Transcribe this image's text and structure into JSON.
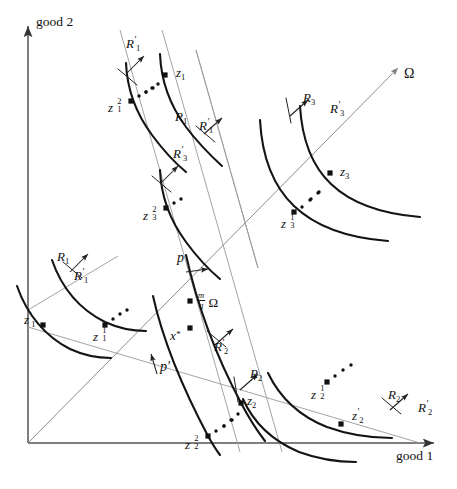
{
  "figure": {
    "type": "economics-edgeworth-offer-curve-diagram",
    "axes": {
      "x_label": "good 1",
      "y_label": "good 2",
      "origin": {
        "x": 28,
        "y": 443
      },
      "x_end": {
        "x": 440,
        "y": 443
      },
      "y_end": {
        "x": 28,
        "y": 22
      }
    },
    "colors": {
      "axis": "#555555",
      "thin_line": "#9a9a9a",
      "curve": "#141414",
      "point": "#111111",
      "text": "#1a1a1a",
      "background": "#ffffff"
    }
  },
  "labels": {
    "y_axis": "good 2",
    "x_axis": "good 1",
    "omega_ray": "Ω",
    "price_p": "p",
    "price_p_prime": "p′",
    "endowment_point": {
      "num": "m",
      "den": "q",
      "omega": "Ω"
    },
    "x_star": "x",
    "x_star_mark": "*"
  },
  "preference_labels": [
    {
      "name": "R1-upper",
      "base": "R",
      "sub": "1",
      "prime": "",
      "x": 175,
      "y": 110
    },
    {
      "name": "R1p-upper",
      "base": "R",
      "sub": "1",
      "prime": "′",
      "x": 199,
      "y": 118
    },
    {
      "name": "R1p-top",
      "base": "R",
      "sub": "1",
      "prime": "′",
      "x": 126,
      "y": 36
    },
    {
      "name": "R3p-mid",
      "base": "R",
      "sub": "3",
      "prime": "′",
      "x": 173,
      "y": 146
    },
    {
      "name": "R1-left",
      "base": "R",
      "sub": "1",
      "prime": "",
      "x": 57,
      "y": 250
    },
    {
      "name": "R1p-left",
      "base": "R",
      "sub": "1",
      "prime": "′",
      "x": 74,
      "y": 268
    },
    {
      "name": "R3-right",
      "base": "R",
      "sub": "3",
      "prime": "",
      "x": 303,
      "y": 91
    },
    {
      "name": "R3p-right",
      "base": "R",
      "sub": "3",
      "prime": "′",
      "x": 330,
      "y": 101
    },
    {
      "name": "R2p-center",
      "base": "R",
      "sub": "2",
      "prime": "′",
      "x": 214,
      "y": 339
    },
    {
      "name": "R2-bottom",
      "base": "R",
      "sub": "2",
      "prime": "",
      "x": 250,
      "y": 367
    },
    {
      "name": "R2-lower",
      "base": "R",
      "sub": "2",
      "prime": "",
      "x": 388,
      "y": 388
    },
    {
      "name": "R2p-lower",
      "base": "R",
      "sub": "2",
      "prime": "′",
      "x": 418,
      "y": 400
    }
  ],
  "allocation_points": [
    {
      "name": "z1",
      "base": "z",
      "sub": "1",
      "sup": "",
      "prime": "",
      "px": 165,
      "py": 75,
      "lx": 176,
      "ly": 66
    },
    {
      "name": "z1-sq",
      "base": "z",
      "sub": "1",
      "sup": "2",
      "prime": "",
      "px": 131,
      "py": 101,
      "lx": 108,
      "ly": 101
    },
    {
      "name": "z3-sq",
      "base": "z",
      "sub": "3",
      "sup": "2",
      "prime": "",
      "px": 166,
      "py": 208,
      "lx": 143,
      "ly": 209
    },
    {
      "name": "z3",
      "base": "z",
      "sub": "3",
      "sup": "",
      "prime": "",
      "px": 330,
      "py": 173,
      "lx": 340,
      "ly": 165
    },
    {
      "name": "z3-one",
      "base": "z",
      "sub": "3",
      "sup": "1",
      "prime": "",
      "px": 294,
      "py": 212,
      "lx": 281,
      "ly": 217
    },
    {
      "name": "z1-prime",
      "base": "z",
      "sub": "1",
      "sup": "",
      "prime": "′",
      "px": 43,
      "py": 325,
      "lx": 24,
      "ly": 312
    },
    {
      "name": "z1-one",
      "base": "z",
      "sub": "1",
      "sup": "1",
      "prime": "",
      "px": 105,
      "py": 325,
      "lx": 93,
      "ly": 330
    },
    {
      "name": "mq-omega",
      "base": "",
      "sub": "",
      "sup": "",
      "prime": "",
      "px": 190,
      "py": 301,
      "lx": 197,
      "ly": 294
    },
    {
      "name": "x-star",
      "base": "x",
      "sub": "",
      "sup": "",
      "prime": "",
      "px": 190,
      "py": 328,
      "lx": 172,
      "ly": 334
    },
    {
      "name": "z2",
      "base": "z",
      "sub": "2",
      "sup": "",
      "prime": "",
      "px": 241,
      "py": 403,
      "lx": 247,
      "ly": 394
    },
    {
      "name": "z2-sq",
      "base": "z",
      "sub": "2",
      "sup": "2",
      "prime": "",
      "px": 208,
      "py": 436,
      "lx": 185,
      "ly": 438
    },
    {
      "name": "z2-one",
      "base": "z",
      "sub": "2",
      "sup": "1",
      "prime": "",
      "px": 327,
      "py": 382,
      "lx": 311,
      "ly": 388
    },
    {
      "name": "z2-prime",
      "base": "z",
      "sub": "2",
      "sup": "",
      "prime": "′",
      "px": 341,
      "py": 424,
      "lx": 352,
      "ly": 408
    }
  ],
  "dotted_runs": [
    {
      "name": "dots-upper-left",
      "points": [
        [
          139,
          96
        ],
        [
          146,
          92
        ],
        [
          153,
          88
        ]
      ]
    },
    {
      "name": "dots-upper-right",
      "points": [
        [
          146,
          92
        ],
        [
          152,
          88
        ],
        [
          158,
          84
        ]
      ]
    },
    {
      "name": "dots-mid",
      "points": [
        [
          174,
          203
        ],
        [
          181,
          199
        ]
      ]
    },
    {
      "name": "dots-z3",
      "points": [
        [
          302,
          207
        ],
        [
          310,
          200
        ],
        [
          318,
          193
        ]
      ]
    },
    {
      "name": "dots-z3b",
      "points": [
        [
          311,
          199
        ],
        [
          319,
          192
        ]
      ]
    },
    {
      "name": "dots-z1left",
      "points": [
        [
          113,
          319
        ],
        [
          120,
          314
        ],
        [
          127,
          310
        ]
      ]
    },
    {
      "name": "dots-z2left",
      "points": [
        [
          216,
          431
        ],
        [
          224,
          426
        ],
        [
          232,
          420
        ]
      ]
    },
    {
      "name": "dots-z2b",
      "points": [
        [
          224,
          426
        ],
        [
          231,
          420
        ],
        [
          238,
          414
        ]
      ]
    },
    {
      "name": "dots-z2right",
      "points": [
        [
          335,
          376
        ],
        [
          343,
          370
        ],
        [
          351,
          365
        ]
      ]
    }
  ]
}
